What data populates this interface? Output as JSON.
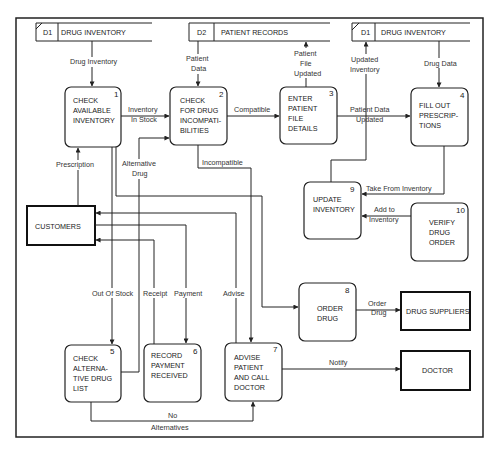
{
  "diagram": {
    "type": "data-flow-diagram",
    "data_stores": [
      {
        "id": "D1",
        "label": "DRUG INVENTORY",
        "position": "top-left"
      },
      {
        "id": "D2",
        "label": "PATIENT RECORDS",
        "position": "top-center"
      },
      {
        "id": "D1",
        "label": "DRUG INVENTORY",
        "position": "top-right"
      }
    ],
    "processes": [
      {
        "number": "1",
        "lines": [
          "CHECK",
          "AVAILABLE",
          "INVENTORY"
        ]
      },
      {
        "number": "2",
        "lines": [
          "CHECK",
          "FOR DRUG",
          "INCOMPATI-",
          "BILITIES"
        ]
      },
      {
        "number": "3",
        "lines": [
          "ENTER",
          "PATIENT",
          "FILE",
          "DETAILS"
        ]
      },
      {
        "number": "4",
        "lines": [
          "FILL OUT",
          "PRESCRIP-",
          "TIONS"
        ]
      },
      {
        "number": "5",
        "lines": [
          "CHECK",
          "ALTERNA-",
          "TIVE DRUG",
          "LIST"
        ]
      },
      {
        "number": "6",
        "lines": [
          "RECORD",
          "PAYMENT",
          "RECEIVED"
        ]
      },
      {
        "number": "7",
        "lines": [
          "ADVISE",
          "PATIENT",
          "AND CALL",
          "DOCTOR"
        ]
      },
      {
        "number": "8",
        "lines": [
          "ORDER",
          "DRUG"
        ]
      },
      {
        "number": "9",
        "lines": [
          "UPDATE",
          "INVENTORY"
        ]
      },
      {
        "number": "10",
        "lines": [
          "VERIFY",
          "DRUG",
          "ORDER"
        ]
      }
    ],
    "external_entities": [
      {
        "label": "CUSTOMERS"
      },
      {
        "label": "DRUG SUPPLIERS"
      },
      {
        "label": "DOCTOR"
      }
    ],
    "flows": {
      "drug_inventory": "Drug  Inventory",
      "patient_data": [
        "Patient",
        "Data"
      ],
      "patient_file_updated": [
        "Patient",
        "File",
        "Updated"
      ],
      "updated_inventory": [
        "Updated",
        "Inventory"
      ],
      "drug_data": "Drug Data",
      "inventory_in_stock": [
        "Inventory",
        "In Stock"
      ],
      "compatible": "Compatible",
      "patient_data_updated": [
        "Patient  Data",
        "Updated"
      ],
      "prescription": "Prescription",
      "alternative_drug": [
        "Alternative",
        "Drug"
      ],
      "incompatible": "Incompatible",
      "take_from_inventory": "Take From Inventory",
      "add_to_inventory": [
        "Add to",
        "Inventory"
      ],
      "out_of_stock": "Out Of Stock",
      "receipt": "Receipt",
      "payment": "Payment",
      "advise": "Advise",
      "order_drug": [
        "Order",
        "Drug"
      ],
      "notify": "Notify",
      "no_alternatives": [
        "No",
        "Alternatives"
      ]
    }
  }
}
